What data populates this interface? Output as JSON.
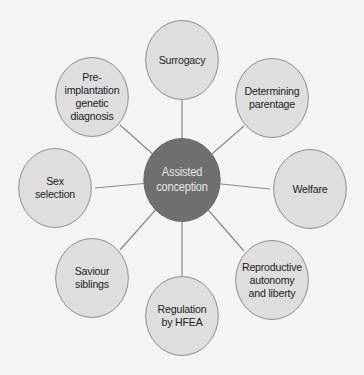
{
  "diagram": {
    "type": "hub-and-spoke mind map",
    "center": {
      "label": "Assisted\nconception",
      "fill": "#6f6f6f",
      "text_color": "#e6e6e6"
    },
    "node_fill": "#dedede",
    "node_border": "#8a8a8a",
    "line_color": "#8a8a8a",
    "nodes": [
      {
        "label": "Surrogacy",
        "position": "top"
      },
      {
        "label": "Determining\nparentage",
        "position": "top-right"
      },
      {
        "label": "Welfare",
        "position": "right"
      },
      {
        "label": "Reproductive\nautonomy\nand liberty",
        "position": "bottom-right"
      },
      {
        "label": "Regulation\nby HFEA",
        "position": "bottom"
      },
      {
        "label": "Saviour\nsiblings",
        "position": "bottom-left"
      },
      {
        "label": "Sex\nselection",
        "position": "left"
      },
      {
        "label": "Pre-implantation\ngenetic\ndiagnosis",
        "position": "top-left"
      }
    ]
  }
}
